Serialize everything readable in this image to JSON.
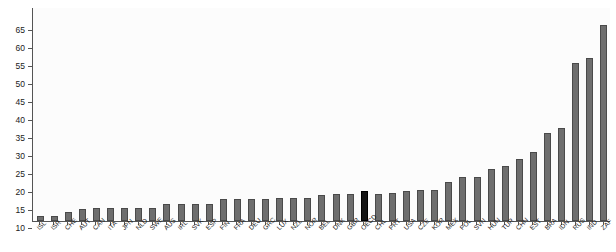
{
  "chart_data": {
    "type": "bar",
    "title": "",
    "subtitle": "",
    "xlabel": "",
    "ylabel": "",
    "ylim": [
      5,
      71
    ],
    "grid": false,
    "legend": null,
    "yticks": [
      10,
      15,
      20,
      25,
      30,
      35,
      40,
      45,
      50,
      55,
      60,
      65
    ],
    "highlight_category": "OECD",
    "highlight_color": "#151515",
    "bar_color": "#6e6e6e",
    "categories": [
      "ISL",
      "ISR",
      "CHE",
      "AUT",
      "CAN",
      "ITA",
      "JPN",
      "NLD",
      "SWE",
      "AUS",
      "IRL",
      "SVK",
      "ESP",
      "FIN",
      "FRA",
      "DEU",
      "GRC",
      "LUX",
      "NZL",
      "NOR",
      "BEL",
      "DNK",
      "GBR",
      "OECD",
      "CHL",
      "PRT",
      "USA",
      "CZE",
      "KOR",
      "MEX",
      "POL",
      "SVN",
      "HUN",
      "TUR",
      "CHN",
      "EST",
      "BRA",
      "IDN",
      "RUS",
      "IND",
      "ZAF"
    ],
    "values": [
      13.0,
      13.0,
      14.2,
      15.1,
      15.2,
      15.2,
      15.2,
      15.3,
      15.4,
      16.3,
      16.4,
      16.4,
      16.4,
      17.8,
      17.8,
      17.8,
      17.9,
      18.0,
      18.0,
      18.0,
      19.0,
      19.2,
      19.3,
      20.0,
      19.2,
      19.4,
      20.1,
      20.3,
      20.4,
      22.4,
      24.0,
      24.0,
      26.0,
      27.0,
      29.0,
      30.8,
      36.0,
      37.5,
      55.5,
      57.0,
      66.0
    ],
    "value_axis_note": "Bars are clipped at the axis floor of 10"
  },
  "axis": {
    "y_tick_labels": [
      "65",
      "60",
      "55",
      "50",
      "45",
      "40",
      "35",
      "30",
      "25",
      "20",
      "15",
      "10"
    ]
  }
}
